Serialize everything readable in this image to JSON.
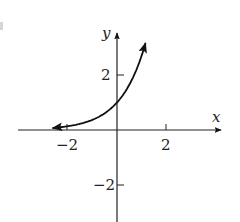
{
  "chart_data": {
    "type": "line",
    "title": "",
    "xlabel": "x",
    "ylabel": "y",
    "function": "y = e^x",
    "series": [
      {
        "name": "y = e^x",
        "x": [
          -2.6,
          -2.0,
          -1.5,
          -1.0,
          -0.5,
          0.0,
          0.5,
          1.0,
          1.15
        ],
        "y": [
          0.07,
          0.14,
          0.22,
          0.37,
          0.61,
          1.0,
          1.65,
          2.72,
          3.16
        ],
        "arrows": [
          "left",
          "right"
        ]
      }
    ],
    "x_ticks": [
      -2,
      2
    ],
    "x_tick_labels": [
      "−2",
      "2"
    ],
    "y_ticks": [
      2,
      -2
    ],
    "y_tick_labels": [
      "2",
      "−2"
    ],
    "xlim": [
      -4,
      4.2
    ],
    "ylim": [
      -3.3,
      3.6
    ],
    "grid": false,
    "legend": null,
    "colors": {
      "axis": "#222222",
      "curve": "#111111"
    }
  }
}
